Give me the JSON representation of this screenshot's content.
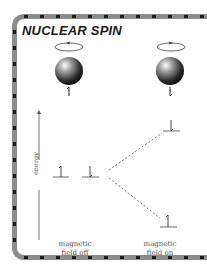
{
  "title": "NUCLEAR SPIN",
  "nuclei": [
    {
      "name": "nucleus-spin-up",
      "rotation": "counterclockwise",
      "spin": "up"
    },
    {
      "name": "nucleus-spin-down",
      "rotation": "clockwise",
      "spin": "down"
    }
  ],
  "axis": {
    "label": "energy"
  },
  "columns": [
    {
      "label_line1": "magnetic",
      "label_line2": "field off"
    },
    {
      "label_line1": "magnetic",
      "label_line2": "field on"
    }
  ],
  "colors": {
    "frame": "#8c8c8c",
    "dots": "#1a1a1a",
    "text": "#1a1a1a",
    "lines": "#555555"
  }
}
